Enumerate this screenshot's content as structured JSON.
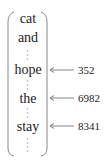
{
  "diagram": {
    "type": "vocabulary-vector",
    "words": [
      {
        "text": "cat",
        "y": 12
      },
      {
        "text": "and",
        "y": 31
      },
      {
        "text": "hope",
        "y": 63
      },
      {
        "text": "the",
        "y": 92
      },
      {
        "text": "stay",
        "y": 120
      }
    ],
    "ellipses": [
      {
        "y1": 50,
        "y2": 62
      },
      {
        "y1": 80,
        "y2": 90
      },
      {
        "y1": 108,
        "y2": 118
      },
      {
        "y1": 138,
        "y2": 152
      }
    ],
    "pointers": [
      {
        "word": "hope",
        "index": "352",
        "y": 70
      },
      {
        "word": "the",
        "index": "6982",
        "y": 98
      },
      {
        "word": "stay",
        "index": "8341",
        "y": 126
      }
    ],
    "colors": {
      "text": "#222222",
      "bracket": "#888888",
      "arrow": "#777777",
      "dots": "#999999"
    }
  }
}
